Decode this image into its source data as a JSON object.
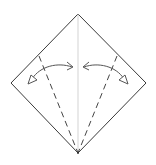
{
  "diagram": {
    "type": "origami-fold-step",
    "description": "Square paper turned as a diamond with center crease; fold left and right bottom edges to the center line (kite fold), then unfold",
    "colors": {
      "paper_outline": "#3a3a3a",
      "center_crease": "#c8c8c8",
      "valley_fold": "#444444",
      "arrow": "#555555",
      "background": "#ffffff"
    },
    "paper": {
      "shape": "diamond",
      "vertices": {
        "top": [
          78,
          14
        ],
        "right": [
          146,
          83
        ],
        "bottom": [
          78,
          153
        ],
        "left": [
          11,
          83
        ]
      }
    },
    "creases": [
      {
        "kind": "existing-crease",
        "from": [
          78,
          14
        ],
        "to": [
          78,
          153
        ]
      }
    ],
    "fold_lines": [
      {
        "kind": "valley-fold",
        "side": "left",
        "from": [
          39,
          56
        ],
        "to": [
          78,
          153
        ]
      },
      {
        "kind": "valley-fold",
        "side": "right",
        "from": [
          117,
          56
        ],
        "to": [
          78,
          153
        ]
      }
    ],
    "arrows": [
      {
        "kind": "fold-and-unfold",
        "side": "left",
        "from": [
          73,
          67
        ],
        "to": [
          29,
          82
        ]
      },
      {
        "kind": "fold-and-unfold",
        "side": "right",
        "from": [
          84,
          67
        ],
        "to": [
          128,
          82
        ]
      }
    ],
    "labels": []
  }
}
